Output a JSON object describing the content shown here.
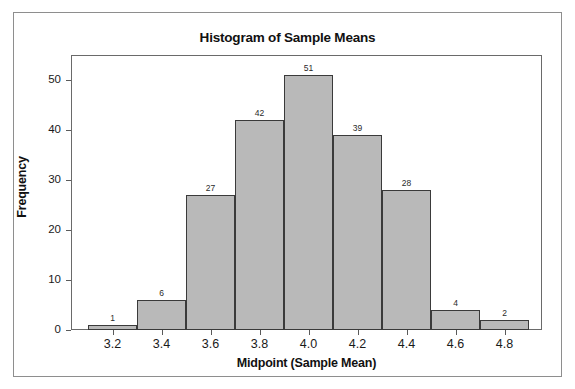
{
  "chart_data": {
    "type": "bar",
    "title": "Histogram of Sample Means",
    "xlabel": "Midpoint (Sample Mean)",
    "ylabel": "Frequency",
    "categories": [
      "3.2",
      "3.4",
      "3.6",
      "3.8",
      "4.0",
      "4.2",
      "4.4",
      "4.6",
      "4.8"
    ],
    "values": [
      1,
      6,
      27,
      42,
      51,
      39,
      28,
      4,
      2
    ],
    "bar_labels": [
      "1",
      "6",
      "27",
      "42",
      "51",
      "39",
      "28",
      "4",
      "2"
    ],
    "xtick_labels": [
      "3.2",
      "3.4",
      "3.6",
      "3.8",
      "4.0",
      "4.2",
      "4.4",
      "4.6",
      "4.8"
    ],
    "ytick_labels": [
      "0",
      "10",
      "20",
      "30",
      "40",
      "50"
    ],
    "ytick_values": [
      0,
      10,
      20,
      30,
      40,
      50
    ],
    "ylim": [
      0,
      55
    ],
    "xlim": [
      3.1,
      4.9
    ],
    "bin_width": 0.2,
    "grid": false,
    "legend": false,
    "bar_fill_color": "#b9b9b9",
    "bar_edge_color": "#3a3a3a",
    "frame_color": "#6a6a6a",
    "text_color": "#111111"
  }
}
